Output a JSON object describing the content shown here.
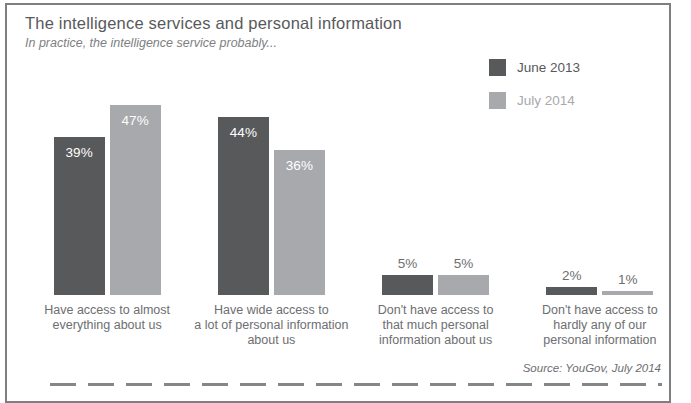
{
  "header": {
    "title": "The intelligence services and personal information",
    "subtitle": "In practice, the intelligence service probably..."
  },
  "legend": {
    "items": [
      {
        "label": "June 2013",
        "swatch_color": "#58595b",
        "label_color": "#58595b"
      },
      {
        "label": "July 2014",
        "swatch_color": "#a7a9ac",
        "label_color": "#a7a9ac"
      }
    ]
  },
  "chart_data": {
    "type": "bar",
    "title": "The intelligence services and personal information",
    "subtitle": "In practice, the intelligence service probably...",
    "categories": [
      "Have access to almost\neverything about us",
      "Have wide access to\na lot of personal information\nabout us",
      "Don't have access to\nthat much personal\ninformation about us",
      "Don't have access to\nhardly any of our\npersonal information"
    ],
    "series": [
      {
        "name": "June 2013",
        "color": "#58595b",
        "values": [
          39,
          44,
          5,
          2
        ]
      },
      {
        "name": "July 2014",
        "color": "#a7a9ac",
        "values": [
          47,
          36,
          5,
          1
        ]
      }
    ],
    "value_suffix": "%",
    "xlabel": "",
    "ylabel": "",
    "ylim": [
      0,
      50
    ],
    "grid": false,
    "legend_position": "top-right",
    "value_labels_inside_when_at_least": 10
  },
  "footer": {
    "source": "Source: YouGov, July 2014"
  },
  "colors": {
    "dark_bar": "#58595b",
    "light_bar": "#a7a9ac",
    "title_text": "#58595b",
    "subtitle_text": "#7d7f82",
    "category_text": "#6d6e71",
    "inside_value_text": "#ffffff",
    "outside_value_text": "#6d6e71",
    "frame_border": "#7d7f81"
  }
}
